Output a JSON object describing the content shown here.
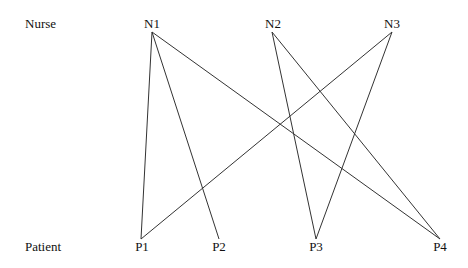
{
  "rows": {
    "top_label": "Nurse",
    "bottom_label": "Patient"
  },
  "nurses": [
    {
      "id": "N1",
      "label": "N1",
      "x": 152
    },
    {
      "id": "N2",
      "label": "N2",
      "x": 272
    },
    {
      "id": "N3",
      "label": "N3",
      "x": 392
    }
  ],
  "patients": [
    {
      "id": "P1",
      "label": "P1",
      "x": 141
    },
    {
      "id": "P2",
      "label": "P2",
      "x": 219
    },
    {
      "id": "P3",
      "label": "P3",
      "x": 316
    },
    {
      "id": "P4",
      "label": "P4",
      "x": 440
    }
  ],
  "edges": [
    {
      "from": "N1",
      "to": "P1"
    },
    {
      "from": "N1",
      "to": "P2"
    },
    {
      "from": "N1",
      "to": "P4"
    },
    {
      "from": "N2",
      "to": "P3"
    },
    {
      "from": "N2",
      "to": "P4"
    },
    {
      "from": "N3",
      "to": "P1"
    },
    {
      "from": "N3",
      "to": "P3"
    }
  ],
  "style": {
    "line_color": "#333333"
  }
}
